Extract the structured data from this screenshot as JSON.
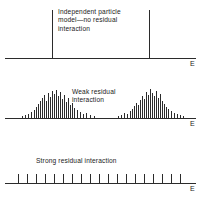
{
  "figure": {
    "axis_label": "E",
    "panels": [
      {
        "id": "independent-particle",
        "caption": "Independent particle\nmodel—no residual\ninteraction",
        "axis_y": 58,
        "axis_x0": 5,
        "axis_x1": 196,
        "caption_x": 58,
        "caption_y": 8,
        "label_x": 190,
        "label_y": 60,
        "levels": [
          {
            "x": 52,
            "height": 48
          },
          {
            "x": 149,
            "height": 48
          }
        ]
      },
      {
        "id": "weak-residual",
        "caption": "Weak residual\ninteraction",
        "axis_y": 118,
        "axis_x0": 5,
        "axis_x1": 196,
        "caption_x": 72,
        "caption_y": 88,
        "label_x": 190,
        "label_y": 120,
        "levels": [
          {
            "x": 22,
            "height": 2
          },
          {
            "x": 25,
            "height": 3
          },
          {
            "x": 28,
            "height": 4
          },
          {
            "x": 31,
            "height": 6
          },
          {
            "x": 34,
            "height": 8
          },
          {
            "x": 36,
            "height": 11
          },
          {
            "x": 38,
            "height": 14
          },
          {
            "x": 40,
            "height": 17
          },
          {
            "x": 42,
            "height": 20
          },
          {
            "x": 44,
            "height": 23
          },
          {
            "x": 46,
            "height": 17
          },
          {
            "x": 48,
            "height": 25
          },
          {
            "x": 50,
            "height": 21
          },
          {
            "x": 52,
            "height": 27
          },
          {
            "x": 54,
            "height": 24
          },
          {
            "x": 56,
            "height": 28
          },
          {
            "x": 58,
            "height": 22
          },
          {
            "x": 60,
            "height": 26
          },
          {
            "x": 62,
            "height": 19
          },
          {
            "x": 64,
            "height": 23
          },
          {
            "x": 66,
            "height": 16
          },
          {
            "x": 68,
            "height": 20
          },
          {
            "x": 70,
            "height": 13
          },
          {
            "x": 72,
            "height": 15
          },
          {
            "x": 74,
            "height": 10
          },
          {
            "x": 77,
            "height": 8
          },
          {
            "x": 80,
            "height": 6
          },
          {
            "x": 83,
            "height": 4
          },
          {
            "x": 86,
            "height": 5
          },
          {
            "x": 90,
            "height": 3
          },
          {
            "x": 94,
            "height": 2
          },
          {
            "x": 118,
            "height": 2
          },
          {
            "x": 121,
            "height": 3
          },
          {
            "x": 124,
            "height": 5
          },
          {
            "x": 127,
            "height": 4
          },
          {
            "x": 130,
            "height": 7
          },
          {
            "x": 132,
            "height": 9
          },
          {
            "x": 134,
            "height": 12
          },
          {
            "x": 136,
            "height": 15
          },
          {
            "x": 138,
            "height": 13
          },
          {
            "x": 140,
            "height": 18
          },
          {
            "x": 142,
            "height": 22
          },
          {
            "x": 144,
            "height": 19
          },
          {
            "x": 146,
            "height": 26
          },
          {
            "x": 148,
            "height": 23
          },
          {
            "x": 150,
            "height": 29
          },
          {
            "x": 152,
            "height": 25
          },
          {
            "x": 154,
            "height": 22
          },
          {
            "x": 156,
            "height": 27
          },
          {
            "x": 158,
            "height": 20
          },
          {
            "x": 160,
            "height": 24
          },
          {
            "x": 162,
            "height": 17
          },
          {
            "x": 164,
            "height": 14
          },
          {
            "x": 166,
            "height": 11
          },
          {
            "x": 168,
            "height": 9
          },
          {
            "x": 171,
            "height": 7
          },
          {
            "x": 174,
            "height": 5
          },
          {
            "x": 177,
            "height": 4
          },
          {
            "x": 180,
            "height": 3
          },
          {
            "x": 183,
            "height": 2
          }
        ]
      },
      {
        "id": "strong-residual",
        "caption": "Strong residual interaction",
        "axis_y": 183,
        "axis_x0": 5,
        "axis_x1": 196,
        "caption_x": 36,
        "caption_y": 157,
        "label_x": 190,
        "label_y": 185,
        "levels": [
          {
            "x": 18,
            "height": 9
          },
          {
            "x": 27,
            "height": 9
          },
          {
            "x": 36,
            "height": 9
          },
          {
            "x": 45,
            "height": 9
          },
          {
            "x": 54,
            "height": 9
          },
          {
            "x": 63,
            "height": 9
          },
          {
            "x": 72,
            "height": 9
          },
          {
            "x": 81,
            "height": 9
          },
          {
            "x": 90,
            "height": 9
          },
          {
            "x": 99,
            "height": 9
          },
          {
            "x": 108,
            "height": 9
          },
          {
            "x": 117,
            "height": 9
          },
          {
            "x": 126,
            "height": 9
          },
          {
            "x": 135,
            "height": 9
          },
          {
            "x": 144,
            "height": 9
          },
          {
            "x": 153,
            "height": 9
          },
          {
            "x": 162,
            "height": 9
          },
          {
            "x": 171,
            "height": 9
          },
          {
            "x": 180,
            "height": 9
          }
        ]
      }
    ]
  },
  "chart_data": {
    "type": "bar",
    "xlabel": "E",
    "ylabel": "",
    "grid": false,
    "legend": null,
    "panels": [
      {
        "name": "Independent particle model—no residual interaction",
        "x": [
          52,
          149
        ],
        "values": [
          48,
          48
        ],
        "annotation": "Independent particle model—no residual interaction",
        "axis_label": "E"
      },
      {
        "name": "Weak residual interaction",
        "x": [
          22,
          25,
          28,
          31,
          34,
          36,
          38,
          40,
          42,
          44,
          46,
          48,
          50,
          52,
          54,
          56,
          58,
          60,
          62,
          64,
          66,
          68,
          70,
          72,
          74,
          77,
          80,
          83,
          86,
          90,
          94,
          118,
          121,
          124,
          127,
          130,
          132,
          134,
          136,
          138,
          140,
          142,
          144,
          146,
          148,
          150,
          152,
          154,
          156,
          158,
          160,
          162,
          164,
          166,
          168,
          171,
          174,
          177,
          180,
          183
        ],
        "values": [
          2,
          3,
          4,
          6,
          8,
          11,
          14,
          17,
          20,
          23,
          17,
          25,
          21,
          27,
          24,
          28,
          22,
          26,
          19,
          23,
          16,
          20,
          13,
          15,
          10,
          8,
          6,
          4,
          5,
          3,
          2,
          2,
          3,
          5,
          4,
          7,
          9,
          12,
          15,
          13,
          18,
          22,
          19,
          26,
          23,
          29,
          25,
          22,
          27,
          20,
          24,
          17,
          14,
          11,
          9,
          7,
          5,
          4,
          3,
          2
        ],
        "annotation": "Weak residual interaction",
        "axis_label": "E"
      },
      {
        "name": "Strong residual interaction",
        "x": [
          18,
          27,
          36,
          45,
          54,
          63,
          72,
          81,
          90,
          99,
          108,
          117,
          126,
          135,
          144,
          153,
          162,
          171,
          180
        ],
        "values": [
          9,
          9,
          9,
          9,
          9,
          9,
          9,
          9,
          9,
          9,
          9,
          9,
          9,
          9,
          9,
          9,
          9,
          9,
          9
        ],
        "annotation": "Strong residual interaction",
        "axis_label": "E"
      }
    ]
  }
}
